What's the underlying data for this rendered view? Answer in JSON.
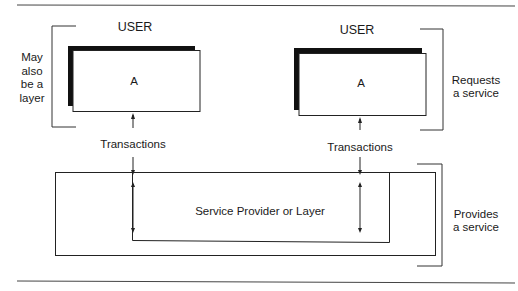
{
  "diagram": {
    "users": [
      {
        "heading": "USER",
        "box_label": "A",
        "arrow_label": "Transactions"
      },
      {
        "heading": "USER",
        "box_label": "A",
        "arrow_label": "Transactions"
      }
    ],
    "provider": {
      "label": "Service Provider or Layer"
    },
    "annotations": {
      "left_bracket": [
        "May",
        "also",
        "be a",
        "layer"
      ],
      "right_bracket_user": [
        "Requests",
        "a service"
      ],
      "right_bracket_provider": [
        "Provides",
        "a service"
      ]
    },
    "colors": {
      "line": "#2a2a2a",
      "shadow": "#111111",
      "background": "#ffffff"
    }
  }
}
